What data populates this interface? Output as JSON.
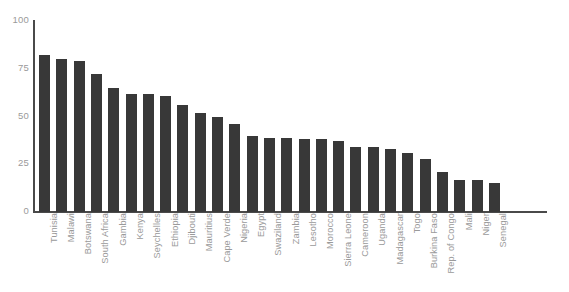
{
  "chart_data": {
    "type": "bar",
    "title": "",
    "subtitle": "",
    "xlabel": "",
    "ylabel": "",
    "ylim": [
      0,
      100
    ],
    "yticks": [
      0,
      25,
      50,
      75,
      100
    ],
    "ytick_labels": [
      "0",
      "25",
      "50",
      "75",
      "100"
    ],
    "grid": false,
    "legend": false,
    "legend_position": "none",
    "bar_color": "#383838",
    "axis_color": "#4a4a4a",
    "tick_label_color": "#9a9a9a",
    "category_label_rotation": -90,
    "categories": [
      "Tunisia",
      "Malawi",
      "Botswana",
      "South Africa",
      "Gambia",
      "Kenya",
      "Seychelles",
      "Ethiopia",
      "Djibouti",
      "Mauritius",
      "Cape Verde",
      "Nigeria",
      "Egypt",
      "Swaziland",
      "Zambia",
      "Lesotho",
      "Morocco",
      "Sierra Leone",
      "Cameroon",
      "Uganda",
      "Madagascar",
      "Togo",
      "Burkina Faso",
      "Rep. of Congo",
      "Mali",
      "Niger",
      "Senegal"
    ],
    "values": [
      82,
      80,
      79,
      72,
      65,
      62,
      62,
      61,
      56,
      52,
      50,
      46,
      40,
      39,
      39,
      38,
      38,
      37,
      34,
      34,
      33,
      31,
      28,
      21,
      17,
      17,
      15
    ]
  }
}
